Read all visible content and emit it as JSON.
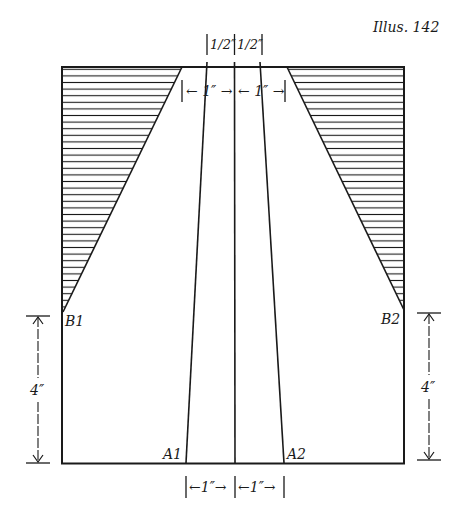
{
  "figure": {
    "title": "Illus. 142",
    "colors": {
      "ink": "#1a1a1a",
      "background": "#ffffff"
    }
  },
  "points": {
    "A1": "A1",
    "A2": "A2",
    "B1": "B1",
    "B2": "B2"
  },
  "dimensions": {
    "top_half_left": "1/2″",
    "top_half_right": "1/2″",
    "top_inch_left": "← 1″ →",
    "top_inch_right": "← 1″ →",
    "bottom_inch_left": "←1″→",
    "bottom_inch_right": "←1″→",
    "left_height": "4″",
    "right_height": "4″"
  }
}
